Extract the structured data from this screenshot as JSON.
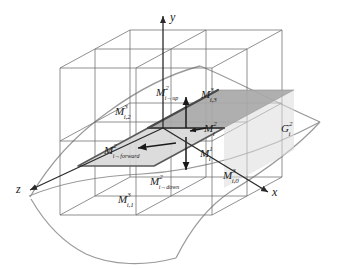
{
  "figure": {
    "background_color": "#ffffff",
    "width": 338,
    "height": 269
  },
  "colors": {
    "grid_line": "#6b6b6b",
    "cube_line": "#585858",
    "surface_line": "#9a9a9a",
    "cell_light": "#d8d8d8",
    "cell_dark": "#a8a8a8",
    "cell_border": "#5a5a5a",
    "cell_edge_highlight": "#7d7d7d",
    "arrow": "#1a1a1a",
    "axis": "#2a2a2a",
    "text": "#1a1a1a"
  },
  "axes": {
    "y": {
      "label": "y",
      "icon": "arrow-up-icon"
    },
    "x": {
      "label": "x",
      "icon": "arrow-right-icon"
    },
    "z": {
      "label": "z",
      "icon": "arrow-down-left-icon"
    }
  },
  "labels": {
    "cell_up": {
      "base": "M",
      "sup": "2",
      "sub": "i→up"
    },
    "cell_down": {
      "base": "M",
      "sup": "2",
      "sub": "i→down"
    },
    "cell_forward": {
      "base": "M",
      "sup": "2",
      "sub": "i→forward"
    },
    "cell_level2": {
      "base": "M",
      "sup": "2",
      "sub": "i"
    },
    "cell_level1": {
      "base": "M",
      "sup": "1",
      "sub": "i"
    },
    "cell_i0": {
      "base": "M",
      "sup": "3",
      "sub": "i,0"
    },
    "cell_i1": {
      "base": "M",
      "sup": "3",
      "sub": "i,1"
    },
    "cell_i2": {
      "base": "M",
      "sup": "3",
      "sub": "i,2"
    },
    "cell_i3": {
      "base": "M",
      "sup": "3",
      "sub": "i,3"
    },
    "surface_g": {
      "base": "G",
      "sup": "2",
      "sub": "i"
    }
  },
  "arrows": {
    "up": {
      "name": "arrow-up-icon",
      "direction": "up"
    },
    "down": {
      "name": "arrow-down-icon",
      "direction": "down"
    },
    "forward": {
      "name": "arrow-left-icon",
      "direction": "left"
    },
    "inward": {
      "name": "arrow-left-short-icon",
      "direction": "left"
    }
  }
}
